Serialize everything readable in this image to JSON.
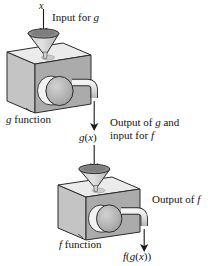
{
  "figure": {
    "background_color": "#ffffff",
    "labels": {
      "input_x": "x",
      "input_for_g": "Input for g",
      "g_function": "g function",
      "g_of_x": "g(x)",
      "output_of_g_line1": "Output of g and",
      "output_of_g_line2": "input for f",
      "f_function": "f function",
      "output_of_f": "Output of f",
      "f_of_g_of_x": "f(g(x))"
    },
    "colors": {
      "outline": "#2b2b2b",
      "top_face": "#ebebeb",
      "left_face": "#c4c4c4",
      "front_face": "#ababab",
      "funnel_rim": "#8f8f8f",
      "funnel_cone": "#bdbdbd",
      "knob_ring": "#f2f2f2",
      "knob_face": "#b3b3b3",
      "pipe": "#dcdcdc",
      "arrow": "#1b1b1b",
      "text": "#141414"
    },
    "machines": [
      {
        "name": "g",
        "label": "g function",
        "funnel_input": "x",
        "output": "g(x)"
      },
      {
        "name": "f",
        "label": "f function",
        "funnel_input": "g(x)",
        "output": "f(g(x))"
      }
    ],
    "flow": [
      {
        "from": "x",
        "to": "g function",
        "kind": "arrow-down"
      },
      {
        "from": "g function",
        "to": "g(x)",
        "kind": "arrow-down"
      },
      {
        "from": "g(x)",
        "to": "f function",
        "kind": "arrow-down"
      },
      {
        "from": "f function",
        "to": "f(g(x))",
        "kind": "arrow-down"
      }
    ]
  }
}
